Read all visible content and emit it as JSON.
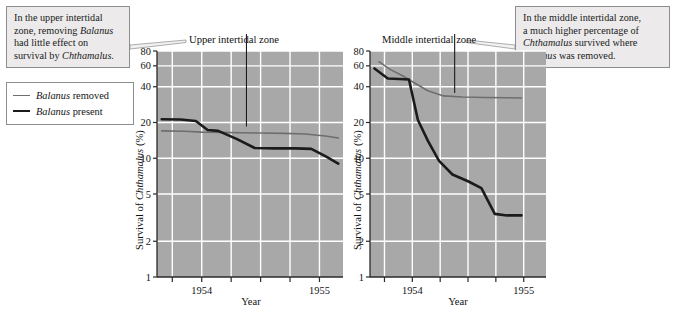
{
  "figure": {
    "callout_left": {
      "name": "upper-zone-callout",
      "line1": "In the upper intertidal",
      "line2_a": "zone, removing ",
      "line2_i": "Balanus",
      "line3": "had little effect on",
      "line4_a": "survival by ",
      "line4_i": "Chthamalus",
      "line4_b": "."
    },
    "callout_right": {
      "name": "middle-zone-callout",
      "line1": "In the middle intertidal zone,",
      "line2": "a much higher percentage of",
      "line3_i": "Chthamalus",
      "line3_a": " survived where",
      "line4_i": "Balanus",
      "line4_a": " was removed."
    },
    "legend": {
      "removed_italic": "Balanus",
      "removed_rest": " removed",
      "present_italic": "Balanus",
      "present_rest": " present",
      "removed_color": "#6e6e6e",
      "present_color": "#1b1b1b"
    },
    "plot_bg": "#a8a8a8",
    "grid_color": "#ffffff",
    "axis_color": "#2a2a2a"
  },
  "chart_data": [
    {
      "type": "line",
      "name": "upper-intertidal-zone",
      "title": "Upper intertidal zone",
      "xlabel": "Year",
      "ylabel_prefix": "Survival of ",
      "ylabel_italic": "Chthamalus",
      "ylabel_suffix": " (%)",
      "yscale": "log",
      "ylim": [
        1,
        80
      ],
      "yticks": [
        1,
        2,
        5,
        10,
        20,
        40,
        60,
        80
      ],
      "ytick_labels": [
        "1",
        "2",
        "5",
        "10",
        "20",
        "40",
        "60",
        "80"
      ],
      "xlim": [
        1953.62,
        1955.2
      ],
      "xticks": [
        1953.75,
        1954.0,
        1954.25,
        1954.5,
        1954.75,
        1955.0
      ],
      "xtick_labels": [
        "",
        "1954",
        "",
        "",
        "",
        "1955"
      ],
      "grid": true,
      "legend_position": "external-left",
      "series": [
        {
          "name": "Balanus removed",
          "color": "#6e6e6e",
          "width": 1.6,
          "x": [
            1953.66,
            1953.85,
            1954.0,
            1954.16,
            1954.33,
            1954.5,
            1954.7,
            1954.88,
            1955.05,
            1955.16
          ],
          "y": [
            17.0,
            16.9,
            16.6,
            16.5,
            16.4,
            16.3,
            16.2,
            16.0,
            15.4,
            14.8
          ]
        },
        {
          "name": "Balanus present",
          "color": "#1b1b1b",
          "width": 2.6,
          "x": [
            1953.66,
            1953.82,
            1953.95,
            1954.05,
            1954.14,
            1954.3,
            1954.45,
            1954.62,
            1954.8,
            1954.93,
            1955.05,
            1955.16
          ],
          "y": [
            21.3,
            21.2,
            20.6,
            17.3,
            17.0,
            14.5,
            12.2,
            12.1,
            12.1,
            12.0,
            10.4,
            9.0
          ]
        }
      ],
      "pointer_line": {
        "x": 1954.38,
        "y_top": 80,
        "y_bottom": 18.5
      }
    },
    {
      "type": "line",
      "name": "middle-intertidal-zone",
      "title": "Middle intertidal zone",
      "xlabel": "Year",
      "ylabel_prefix": "Survival of ",
      "ylabel_italic": "Chthamalus",
      "ylabel_suffix": " (%)",
      "yscale": "log",
      "ylim": [
        1,
        80
      ],
      "yticks": [
        1,
        2,
        5,
        10,
        20,
        40,
        60,
        80
      ],
      "ytick_labels": [
        "1",
        "2",
        "5",
        "10",
        "20",
        "40",
        "60",
        "80"
      ],
      "xlim": [
        1953.62,
        1955.2
      ],
      "xticks": [
        1953.75,
        1954.0,
        1954.25,
        1954.5,
        1954.75,
        1955.0
      ],
      "xtick_labels": [
        "",
        "1954",
        "",
        "",
        "",
        "1955"
      ],
      "grid": true,
      "legend_position": "external-left",
      "series": [
        {
          "name": "Balanus removed",
          "color": "#6e6e6e",
          "width": 1.6,
          "x": [
            1953.7,
            1953.8,
            1953.92,
            1954.02,
            1954.14,
            1954.28,
            1954.45,
            1954.65,
            1954.85,
            1954.98
          ],
          "y": [
            65.0,
            56.0,
            49.0,
            43.0,
            37.0,
            33.5,
            32.8,
            32.5,
            32.3,
            32.2
          ]
        },
        {
          "name": "Balanus present",
          "color": "#1b1b1b",
          "width": 2.6,
          "x": [
            1953.66,
            1953.78,
            1953.88,
            1953.97,
            1954.05,
            1954.14,
            1954.24,
            1954.36,
            1954.5,
            1954.62,
            1954.74,
            1954.85,
            1954.98
          ],
          "y": [
            57.0,
            47.0,
            46.5,
            46.0,
            21.0,
            14.0,
            9.5,
            7.3,
            6.4,
            5.6,
            3.4,
            3.3,
            3.3
          ]
        }
      ],
      "pointer_line": {
        "x": 1954.38,
        "y_top": 80,
        "y_bottom": 35.5
      }
    }
  ]
}
